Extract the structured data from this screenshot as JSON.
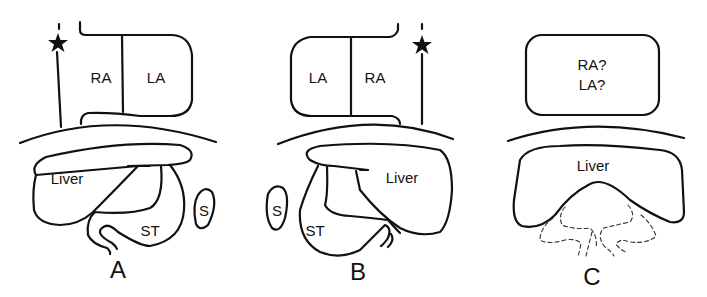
{
  "figure": {
    "panels": [
      {
        "id": "A",
        "label": "A",
        "atria": {
          "left_box": "RA",
          "right_box": "LA"
        },
        "abdomen": {
          "liver": "Liver",
          "stomach": "ST",
          "spleen": "S"
        },
        "marker": "star-icon"
      },
      {
        "id": "B",
        "label": "B",
        "atria": {
          "left_box": "LA",
          "right_box": "RA"
        },
        "abdomen": {
          "liver": "Liver",
          "stomach": "ST",
          "spleen": "S"
        },
        "marker": "star-icon"
      },
      {
        "id": "C",
        "label": "C",
        "atria": {
          "line1": "RA?",
          "line2": "LA?"
        },
        "abdomen": {
          "liver": "Liver"
        }
      }
    ],
    "colors": {
      "ink": "#111111",
      "background": "#ffffff"
    }
  }
}
